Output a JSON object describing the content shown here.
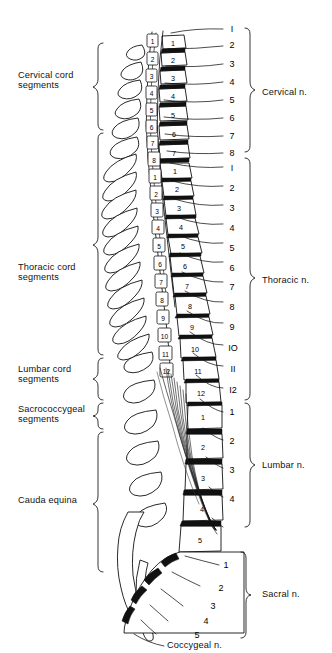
{
  "figure": {
    "background_color": "#ffffff",
    "ink_color": "#111111",
    "width": 332,
    "height": 653
  },
  "left_labels": [
    {
      "id": "cervical-cord-segments",
      "line1": "Cervical cord",
      "line2": "segments",
      "text_x": 18,
      "text_y": 78,
      "brace_top": 43,
      "brace_bottom": 130,
      "brace_x": 98
    },
    {
      "id": "thoracic-cord-segments",
      "line1": "Thoracic cord",
      "line2": "segments",
      "text_x": 18,
      "text_y": 270,
      "brace_top": 133,
      "brace_bottom": 355,
      "brace_x": 98
    },
    {
      "id": "lumbar-cord-segments",
      "line1": "Lumbar cord",
      "line2": "segments",
      "text_x": 18,
      "text_y": 372,
      "brace_top": 358,
      "brace_bottom": 400,
      "brace_x": 98
    },
    {
      "id": "sacrococcygeal-segments",
      "line1": "Sacrococcygeal",
      "line2": "segments",
      "text_x": 18,
      "text_y": 412,
      "brace_top": 403,
      "brace_bottom": 428,
      "brace_x": 98
    },
    {
      "id": "cauda-equina",
      "line1": "Cauda equina",
      "line2": "",
      "text_x": 18,
      "text_y": 502,
      "brace_top": 432,
      "brace_bottom": 572,
      "brace_x": 98
    }
  ],
  "right_labels": [
    {
      "id": "cervical-nerves",
      "text": "Cervical n.",
      "text_x": 262,
      "text_y": 92,
      "brace_top": 28,
      "brace_bottom": 153,
      "brace_x": 249
    },
    {
      "id": "thoracic-nerves",
      "text": "Thoracic n.",
      "text_x": 262,
      "text_y": 281,
      "brace_top": 158,
      "brace_bottom": 400,
      "brace_x": 249
    },
    {
      "id": "lumbar-nerves",
      "text": "Lumbar n.",
      "text_x": 262,
      "text_y": 465,
      "brace_top": 403,
      "brace_bottom": 527,
      "brace_x": 249
    },
    {
      "id": "sacral-nerves",
      "text": "Sacral n.",
      "text_x": 262,
      "text_y": 595,
      "brace_top": 552,
      "brace_bottom": 638,
      "brace_x": 249
    },
    {
      "id": "coccygeal-nerve",
      "text": "Coccygeal n.",
      "text_x": 185,
      "text_y": 645,
      "brace_top": null,
      "brace_bottom": null,
      "brace_x": null
    }
  ],
  "nerve_roots": {
    "cervical": {
      "group": "Cervical n.",
      "labels": [
        "I",
        "2",
        "3",
        "4",
        "5",
        "6",
        "7",
        "8"
      ],
      "label_x": 232,
      "label_y": [
        29,
        46,
        64,
        82,
        100,
        118,
        136,
        153
      ],
      "leader_start_x": [
        172,
        168,
        166,
        165,
        164,
        164,
        165,
        167
      ],
      "leader_start_y": [
        32,
        48,
        64,
        80,
        96,
        112,
        128,
        144
      ]
    },
    "thoracic": {
      "group": "Thoracic n.",
      "labels": [
        "I",
        "2",
        "3",
        "4",
        "5",
        "6",
        "7",
        "8",
        "9",
        "IO",
        "II",
        "I2"
      ],
      "label_x": 232,
      "label_y": [
        170,
        190,
        210,
        230,
        250,
        270,
        290,
        310,
        330,
        350,
        370,
        390
      ],
      "leader_start_x": [
        170,
        172,
        174,
        176,
        178,
        180,
        182,
        184,
        186,
        188,
        190,
        192
      ],
      "leader_start_y": [
        160,
        178,
        196,
        214,
        232,
        250,
        268,
        286,
        304,
        322,
        340,
        358
      ]
    },
    "lumbar": {
      "group": "Lumbar n.",
      "labels": [
        "1",
        "2",
        "3",
        "4"
      ],
      "label_x": 232,
      "label_y": [
        413,
        442,
        471,
        500
      ],
      "leader_start_x": [
        196,
        200,
        204,
        208
      ],
      "leader_start_y": [
        398,
        424,
        450,
        478
      ],
      "extra_unlabeled_line": true
    },
    "sacral": {
      "group": "Sacral n.",
      "labels": [
        "1",
        "2",
        "3",
        "4",
        "5"
      ],
      "label_x": 226,
      "label_y": [
        566,
        588,
        606,
        622,
        635
      ],
      "leader_start_x": [
        186,
        178,
        170,
        162,
        156
      ],
      "leader_start_y": [
        528,
        544,
        560,
        576,
        592
      ]
    },
    "coccygeal": {
      "group": "Coccygeal n.",
      "labels": [
        "Coccygeal n."
      ],
      "leader_start_x": 152,
      "leader_start_y": 610
    }
  },
  "cord_segments": {
    "description": "Numbered spinal cord segments shown as small boxes inside the vertebral canal",
    "cervical": [
      "1",
      "2",
      "3",
      "4",
      "5",
      "6",
      "7",
      "8"
    ],
    "thoracic": [
      "1",
      "2",
      "3",
      "4",
      "5",
      "6",
      "7",
      "8",
      "9",
      "10",
      "11",
      "12"
    ],
    "lumbar": [
      "1",
      "2",
      "3",
      "4",
      "5"
    ],
    "sacral": [
      "1",
      "2",
      "3",
      "4",
      "5"
    ]
  },
  "vertebrae": {
    "description": "Vertebral bodies numbered along the anterior column",
    "cervical": [
      "1",
      "2",
      "3",
      "4",
      "5",
      "6",
      "7"
    ],
    "thoracic": [
      "1",
      "2",
      "3",
      "4",
      "5",
      "6",
      "7",
      "8",
      "9",
      "10",
      "11",
      "12"
    ],
    "lumbar": [
      "1",
      "2",
      "3",
      "4",
      "5"
    ]
  }
}
